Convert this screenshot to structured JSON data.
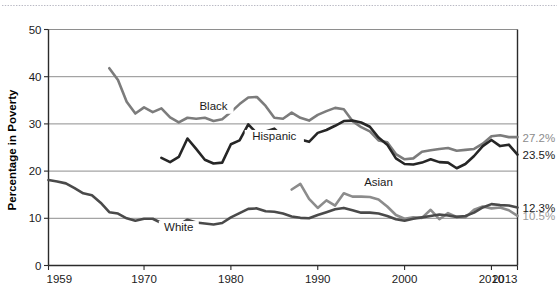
{
  "chart_data": {
    "type": "line",
    "title": "",
    "xlabel": "",
    "ylabel": "Percentage in Poverty",
    "xlim": [
      1959,
      2013
    ],
    "ylim": [
      0,
      50
    ],
    "grid": true,
    "legend_position": "inline-labels",
    "xticks": [
      "1959",
      "1970",
      "1980",
      "1990",
      "2000",
      "2010",
      "2013"
    ],
    "xtick_values": [
      1959,
      1970,
      1980,
      1990,
      2000,
      2010,
      2013
    ],
    "yticks": [
      "0",
      "10",
      "20",
      "30",
      "40",
      "50"
    ],
    "ytick_values": [
      0,
      10,
      20,
      30,
      40,
      50
    ],
    "series": [
      {
        "name": "Black",
        "color": "#7c7c7c",
        "label_x": 1978,
        "label_y": 33.0,
        "end_label": "27.2%",
        "end_label_color": "#8c8c8c",
        "x": [
          1966,
          1967,
          1968,
          1969,
          1970,
          1971,
          1972,
          1973,
          1974,
          1975,
          1976,
          1977,
          1978,
          1979,
          1980,
          1981,
          1982,
          1983,
          1984,
          1985,
          1986,
          1987,
          1988,
          1989,
          1990,
          1991,
          1992,
          1993,
          1994,
          1995,
          1996,
          1997,
          1998,
          1999,
          2000,
          2001,
          2002,
          2003,
          2004,
          2005,
          2006,
          2007,
          2008,
          2009,
          2010,
          2011,
          2012,
          2013
        ],
        "values": [
          41.8,
          39.3,
          34.7,
          32.2,
          33.5,
          32.5,
          33.3,
          31.4,
          30.3,
          31.3,
          31.1,
          31.3,
          30.6,
          31.0,
          32.5,
          34.2,
          35.6,
          35.7,
          33.8,
          31.3,
          31.1,
          32.4,
          31.3,
          30.7,
          31.9,
          32.7,
          33.4,
          33.1,
          30.6,
          29.3,
          28.4,
          26.5,
          26.1,
          23.6,
          22.5,
          22.7,
          24.1,
          24.4,
          24.7,
          24.9,
          24.3,
          24.5,
          24.7,
          25.8,
          27.4,
          27.6,
          27.2,
          27.2
        ]
      },
      {
        "name": "Hispanic",
        "color": "#262626",
        "label_x": 1985,
        "label_y": 26.6,
        "end_label": "23.5%",
        "end_label_color": "#1b1b1b",
        "x": [
          1972,
          1973,
          1974,
          1975,
          1976,
          1977,
          1978,
          1979,
          1980,
          1981,
          1982,
          1983,
          1984,
          1985,
          1986,
          1987,
          1988,
          1989,
          1990,
          1991,
          1992,
          1993,
          1994,
          1995,
          1996,
          1997,
          1998,
          1999,
          2000,
          2001,
          2002,
          2003,
          2004,
          2005,
          2006,
          2007,
          2008,
          2009,
          2010,
          2011,
          2012,
          2013
        ],
        "values": [
          22.8,
          21.9,
          23.0,
          26.9,
          24.7,
          22.4,
          21.6,
          21.8,
          25.7,
          26.5,
          29.9,
          28.0,
          28.4,
          29.0,
          27.3,
          28.0,
          26.7,
          26.2,
          28.1,
          28.7,
          29.6,
          30.6,
          30.7,
          30.3,
          29.4,
          27.1,
          25.6,
          22.7,
          21.5,
          21.4,
          21.8,
          22.5,
          21.9,
          21.8,
          20.6,
          21.5,
          23.2,
          25.3,
          26.6,
          25.3,
          25.6,
          23.5
        ]
      },
      {
        "name": "Asian",
        "color": "#8c8c8c",
        "label_x": 1997,
        "label_y": 16.8,
        "end_label": "10.5%",
        "end_label_color": "#9b9b9b",
        "x": [
          1987,
          1988,
          1989,
          1990,
          1991,
          1992,
          1993,
          1994,
          1995,
          1996,
          1997,
          1998,
          1999,
          2000,
          2001,
          2002,
          2003,
          2004,
          2005,
          2006,
          2007,
          2008,
          2009,
          2010,
          2011,
          2012,
          2013
        ],
        "values": [
          16.1,
          17.3,
          14.1,
          12.2,
          13.8,
          12.7,
          15.3,
          14.6,
          14.6,
          14.5,
          14.0,
          12.5,
          10.7,
          9.9,
          10.2,
          10.1,
          11.8,
          9.8,
          11.1,
          10.3,
          10.2,
          11.8,
          12.5,
          12.1,
          12.3,
          11.7,
          10.5
        ]
      },
      {
        "name": "White",
        "color": "#4a4a4a",
        "label_x": 1974,
        "label_y": 7.3,
        "end_label": "12.3%",
        "end_label_color": "#1b1b1b",
        "x": [
          1959,
          1960,
          1961,
          1962,
          1963,
          1964,
          1965,
          1966,
          1967,
          1968,
          1969,
          1970,
          1971,
          1972,
          1973,
          1974,
          1975,
          1976,
          1977,
          1978,
          1979,
          1980,
          1981,
          1982,
          1983,
          1984,
          1985,
          1986,
          1987,
          1988,
          1989,
          1990,
          1991,
          1992,
          1993,
          1994,
          1995,
          1996,
          1997,
          1998,
          1999,
          2000,
          2001,
          2002,
          2003,
          2004,
          2005,
          2006,
          2007,
          2008,
          2009,
          2010,
          2011,
          2012,
          2013
        ],
        "values": [
          18.1,
          17.8,
          17.4,
          16.4,
          15.3,
          14.9,
          13.3,
          11.3,
          11.0,
          10.0,
          9.5,
          9.9,
          9.9,
          9.0,
          8.4,
          8.6,
          9.7,
          9.1,
          8.9,
          8.7,
          9.0,
          10.2,
          11.1,
          12.0,
          12.1,
          11.5,
          11.4,
          11.0,
          10.4,
          10.1,
          10.0,
          10.7,
          11.3,
          11.9,
          12.2,
          11.7,
          11.2,
          11.2,
          11.0,
          10.5,
          9.8,
          9.5,
          9.9,
          10.2,
          10.5,
          10.8,
          10.6,
          10.3,
          10.5,
          11.2,
          12.3,
          13.0,
          12.8,
          12.7,
          12.3
        ]
      }
    ]
  },
  "decor": {
    "top_rule": "dotted-separator"
  }
}
